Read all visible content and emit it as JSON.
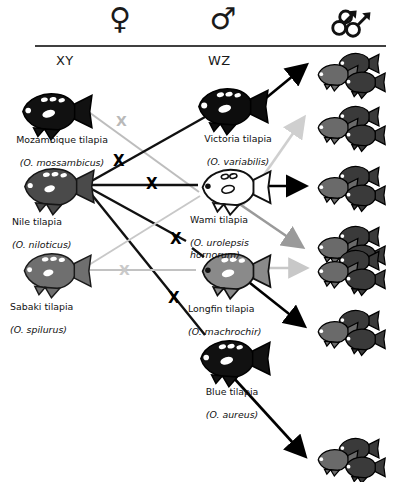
{
  "figure": {
    "rule_color": "#000000"
  },
  "header": {
    "columns": [
      {
        "id": "female",
        "symbol": "♀",
        "icon_name": "female-symbol",
        "sub_label": "XY"
      },
      {
        "id": "male",
        "symbol": "♂",
        "icon_name": "male-symbol",
        "sub_label": "WZ"
      },
      {
        "id": "progeny",
        "symbol": "♂♂♂",
        "icon_name": "all-male-progeny-symbol",
        "sub_label": ""
      }
    ]
  },
  "species": [
    {
      "id": "mossambicus",
      "common": "Mozambique tilapia",
      "scientific": "(O. mossambicus)",
      "role": "female",
      "color": "#111111",
      "shade": "black"
    },
    {
      "id": "niloticus",
      "common": "Nile tilapia",
      "scientific": "(O. niloticus)",
      "role": "female",
      "color": "#4a4a4a",
      "shade": "dark-gray"
    },
    {
      "id": "spilurus",
      "common": "Sabaki tilapia",
      "scientific": "(O. spilurus)",
      "role": "female",
      "color": "#6f6f6f",
      "shade": "gray"
    },
    {
      "id": "variabilis",
      "common": "Victoria tilapia",
      "scientific": "(O. variabilis)",
      "role": "male",
      "color": "#0d0d0d",
      "shade": "black"
    },
    {
      "id": "urolepsis",
      "common": "Wami tilapia",
      "scientific": "(O. urolepsis\nhornorum)",
      "role": "male",
      "color": "#ffffff",
      "shade": "white"
    },
    {
      "id": "machrochir",
      "common": "Longfin tilapia",
      "scientific": "(O. machrochir)",
      "role": "male",
      "color": "#8a8a8a",
      "shade": "mid-gray"
    },
    {
      "id": "aureus",
      "common": "Blue tilapia",
      "scientific": "(O. aureus)",
      "role": "male",
      "color": "#111111",
      "shade": "black"
    }
  ],
  "crosses": [
    {
      "id": "c1",
      "female": "mossambicus",
      "male": "urolepsis",
      "marker": "X",
      "marker_color": "#b9b9b9",
      "line_color": "#b9b9b9"
    },
    {
      "id": "c2",
      "female": "niloticus",
      "male": "variabilis",
      "marker": "X",
      "marker_color": "#000000",
      "line_color": "#111111"
    },
    {
      "id": "c3",
      "female": "niloticus",
      "male": "urolepsis",
      "marker": "X",
      "marker_color": "#000000",
      "line_color": "#111111"
    },
    {
      "id": "c4",
      "female": "niloticus",
      "male": "machrochir",
      "marker": "X",
      "marker_color": "#000000",
      "line_color": "#111111"
    },
    {
      "id": "c5",
      "female": "niloticus",
      "male": "aureus",
      "marker": "X",
      "marker_color": "#000000",
      "line_color": "#111111"
    },
    {
      "id": "c6",
      "female": "spilurus",
      "male": "machrochir",
      "marker": "X",
      "marker_color": "#c9c9c9",
      "line_color": "#c2c2c2"
    }
  ],
  "progeny_groups": [
    {
      "id": "g1",
      "fish_count": 3,
      "arrow_color": "#000000",
      "from": "variabilis"
    },
    {
      "id": "g2",
      "fish_count": 3,
      "arrow_color": "#cfcfcf",
      "from": "mossambicus-cross"
    },
    {
      "id": "g3",
      "fish_count": 3,
      "arrow_color": "#000000",
      "from": "urolepsis"
    },
    {
      "id": "g4",
      "fish_count": 3,
      "arrow_color": "#9a9a9a",
      "from": "urolepsis"
    },
    {
      "id": "g5",
      "fish_count": 3,
      "arrow_color": "#c8c8c8",
      "from": "machrochir"
    },
    {
      "id": "g6",
      "fish_count": 3,
      "arrow_color": "#000000",
      "from": "machrochir"
    },
    {
      "id": "g7",
      "fish_count": 3,
      "arrow_color": "#000000",
      "from": "aureus"
    }
  ]
}
